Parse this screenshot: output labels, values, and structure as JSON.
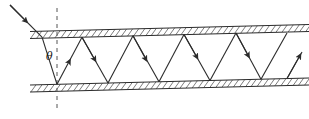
{
  "figure": {
    "stroke_color": "#2b2b2b",
    "hatch_color": "#6e6e6e",
    "background": "#ffffff",
    "width": 309,
    "height": 119
  },
  "labels": {
    "theta": "θ"
  },
  "geometry": {
    "top_wall": {
      "inner_left": {
        "x": 30,
        "y": 38.5
      },
      "inner_right": {
        "x": 309,
        "y": 31.5
      },
      "outer_left": {
        "x": 30,
        "y": 31.5
      },
      "outer_right": {
        "x": 309,
        "y": 24.5
      },
      "thickness": 7
    },
    "bottom_wall": {
      "inner_left": {
        "x": 30,
        "y": 85.0
      },
      "inner_right": {
        "x": 309,
        "y": 78.0
      },
      "outer_left": {
        "x": 30,
        "y": 92.0
      },
      "outer_right": {
        "x": 309,
        "y": 85.0
      },
      "thickness": 7
    },
    "normal_line": {
      "x": 57,
      "y_top": 8,
      "y_bottom": 110,
      "dash": "4,4"
    },
    "incident_ray": {
      "from": {
        "x": 10,
        "y": 5
      },
      "to": {
        "x": 42,
        "y": 37.2
      }
    },
    "zigzag_vertices": [
      {
        "x": 42.0,
        "y": 37.2,
        "wall": "top"
      },
      {
        "x": 57.0,
        "y": 84.3,
        "wall": "bottom"
      },
      {
        "x": 82.0,
        "y": 37.2,
        "wall": "top"
      },
      {
        "x": 108.0,
        "y": 83.0,
        "wall": "bottom"
      },
      {
        "x": 133.0,
        "y": 35.7,
        "wall": "top"
      },
      {
        "x": 159.0,
        "y": 81.7,
        "wall": "bottom"
      },
      {
        "x": 184.0,
        "y": 34.4,
        "wall": "top"
      },
      {
        "x": 210.0,
        "y": 80.4,
        "wall": "bottom"
      },
      {
        "x": 236.0,
        "y": 33.1,
        "wall": "top"
      },
      {
        "x": 261.0,
        "y": 79.2,
        "wall": "bottom"
      },
      {
        "x": 287.0,
        "y": 78.5,
        "wall": "bottom"
      },
      {
        "x": 300.0,
        "y": 55.0,
        "wall": "exit"
      }
    ],
    "angle_label_position": {
      "x": 46,
      "y": 60
    }
  }
}
